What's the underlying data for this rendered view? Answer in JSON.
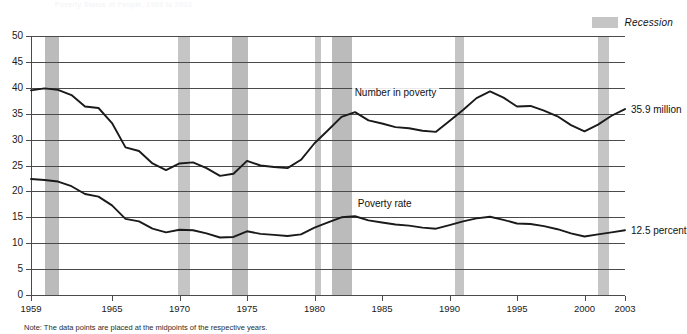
{
  "chart_data": {
    "type": "line",
    "title": "",
    "xlabel": "",
    "ylabel": "",
    "xlim": [
      1959,
      2003
    ],
    "ylim": [
      0,
      50
    ],
    "grid": true,
    "legend_position": "top-right",
    "ytick_labels": [
      "0",
      "5",
      "10",
      "15",
      "20",
      "25",
      "30",
      "35",
      "40",
      "45",
      "50"
    ],
    "ytick_values": [
      0,
      5,
      10,
      15,
      20,
      25,
      30,
      35,
      40,
      45,
      50
    ],
    "xtick_labels": [
      "1959",
      "1965",
      "1970",
      "1975",
      "1980",
      "1985",
      "1990",
      "1995",
      "2000",
      "2003"
    ],
    "xtick_values": [
      1959,
      1965,
      1970,
      1975,
      1980,
      1985,
      1990,
      1995,
      2000,
      2003
    ],
    "x": [
      1959,
      1960,
      1961,
      1962,
      1963,
      1964,
      1965,
      1966,
      1967,
      1968,
      1969,
      1970,
      1971,
      1972,
      1973,
      1974,
      1975,
      1976,
      1977,
      1978,
      1979,
      1980,
      1981,
      1982,
      1983,
      1984,
      1985,
      1986,
      1987,
      1988,
      1989,
      1990,
      1991,
      1992,
      1993,
      1994,
      1995,
      1996,
      1997,
      1998,
      1999,
      2000,
      2001,
      2002,
      2003
    ],
    "series": [
      {
        "name": "Number in poverty",
        "units": "million",
        "end_label": "35.9 million",
        "values": [
          39.5,
          39.9,
          39.6,
          38.6,
          36.4,
          36.1,
          33.2,
          28.5,
          27.8,
          25.4,
          24.1,
          25.4,
          25.6,
          24.5,
          23.0,
          23.4,
          25.9,
          25.0,
          24.7,
          24.5,
          26.1,
          29.3,
          31.8,
          34.4,
          35.3,
          33.7,
          33.1,
          32.4,
          32.2,
          31.7,
          31.5,
          33.6,
          35.7,
          38.0,
          39.3,
          38.1,
          36.4,
          36.5,
          35.6,
          34.5,
          32.8,
          31.6,
          32.9,
          34.6,
          35.9
        ]
      },
      {
        "name": "Poverty rate",
        "units": "percent",
        "end_label": "12.5 percent",
        "values": [
          22.4,
          22.2,
          21.9,
          21.0,
          19.5,
          19.0,
          17.3,
          14.7,
          14.2,
          12.8,
          12.1,
          12.6,
          12.5,
          11.9,
          11.1,
          11.2,
          12.3,
          11.8,
          11.6,
          11.4,
          11.7,
          13.0,
          14.0,
          15.0,
          15.2,
          14.4,
          14.0,
          13.6,
          13.4,
          13.0,
          12.8,
          13.5,
          14.2,
          14.8,
          15.1,
          14.5,
          13.8,
          13.7,
          13.3,
          12.7,
          11.9,
          11.3,
          11.7,
          12.1,
          12.5
        ]
      }
    ],
    "recessions": [
      {
        "label": "1960-1961",
        "start": 1960.0,
        "end": 1961.1
      },
      {
        "label": "1969-1970",
        "start": 1969.9,
        "end": 1970.8
      },
      {
        "label": "1973-1975",
        "start": 1973.9,
        "end": 1975.1
      },
      {
        "label": "1980",
        "start": 1980.0,
        "end": 1980.5
      },
      {
        "label": "1981-1982",
        "start": 1981.3,
        "end": 1982.8
      },
      {
        "label": "1990-1991",
        "start": 1990.4,
        "end": 1991.1
      },
      {
        "label": "2001",
        "start": 2001.0,
        "end": 2001.8
      }
    ],
    "legend": [
      {
        "label": "Recession",
        "color": "#c5c5c5",
        "style": "band"
      }
    ],
    "annotations": [
      {
        "text": "Number in poverty",
        "x": 1986.0,
        "y": 39.0
      },
      {
        "text": "Poverty rate",
        "x": 1985.2,
        "y": 17.6
      }
    ],
    "colors": {
      "line": "#1a1a1a",
      "grid": "#4a4a4a",
      "recession_band": "#c5c5c5",
      "recession_band_dark": "#bbbbbb",
      "background": "#ffffff"
    }
  },
  "note": "Note:  The data points are placed at the midpoints of the respective years.",
  "top_faint_text": "Poverty Status of People, 1959 to 2003"
}
